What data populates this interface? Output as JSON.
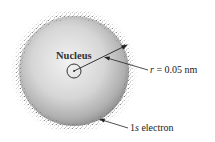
{
  "diagram": {
    "labels": {
      "nucleus": "Nucleus",
      "radius_var": "r",
      "radius_value": " = 0.05 nm",
      "electron_prefix": "1",
      "electron_orbital": "s",
      "electron_suffix": " electron"
    },
    "colors": {
      "sphere_light": "#eeeeee",
      "sphere_dark": "#9a9a9a",
      "stipple": "#555555",
      "line": "#222222"
    }
  }
}
